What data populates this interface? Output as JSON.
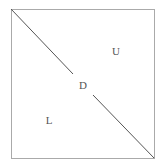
{
  "diagram": {
    "type": "matrix-decomposition",
    "box": {
      "x": 11,
      "y": 9,
      "width": 143,
      "height": 149,
      "stroke": "#aaaaaa"
    },
    "diagonal": {
      "stroke": "#555555",
      "segments": [
        {
          "x1": 11,
          "y1": 9,
          "x2": 73,
          "y2": 74
        },
        {
          "x1": 93,
          "y1": 95,
          "x2": 154,
          "y2": 158
        }
      ]
    },
    "labels": [
      {
        "id": "upper",
        "text": "U",
        "x": 116,
        "y": 55
      },
      {
        "id": "diagonal",
        "text": "D",
        "x": 83,
        "y": 89
      },
      {
        "id": "lower",
        "text": "L",
        "x": 49,
        "y": 124
      }
    ]
  }
}
